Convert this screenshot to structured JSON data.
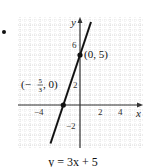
{
  "chart_data": {
    "type": "line",
    "title": "",
    "caption": "y = 3x + 5",
    "xlabel": "x",
    "ylabel": "y",
    "xlim": [
      -6,
      6
    ],
    "ylim": [
      -4,
      8
    ],
    "grid": true,
    "grid_minor_step": 0.5,
    "x_ticks": [
      -4,
      2,
      4
    ],
    "y_ticks": [
      6,
      2,
      -2
    ],
    "x_tick_labels": [
      "−4",
      "2",
      "4"
    ],
    "y_tick_labels": [
      "6",
      "2",
      "−2"
    ],
    "series": [
      {
        "name": "y = 3x + 5",
        "slope": 3,
        "intercept": 5,
        "x": [
          -2.95,
          1.1
        ],
        "y": [
          -3.85,
          8.3
        ],
        "color": "#111111"
      }
    ],
    "points": [
      {
        "x": 0,
        "y": 5,
        "label": "(0, 5)"
      },
      {
        "x": -1.6667,
        "y": 0,
        "label": "(−5/3, 0)",
        "label_num": "5",
        "label_den": "3"
      }
    ],
    "legend": "none"
  },
  "page": {
    "bullet": "•",
    "caption": "y = 3x + 5",
    "axis_x_label": "x",
    "axis_y_label": "y",
    "point_a_label": "(0, 5)",
    "point_b_prefix": "(−",
    "point_b_num": "5",
    "point_b_den": "3",
    "point_b_suffix": ", 0)",
    "tick_x_neg4": "−4",
    "tick_x_2": "2",
    "tick_x_4": "4",
    "tick_y_6": "6",
    "tick_y_2": "2",
    "tick_y_neg2": "−2"
  }
}
